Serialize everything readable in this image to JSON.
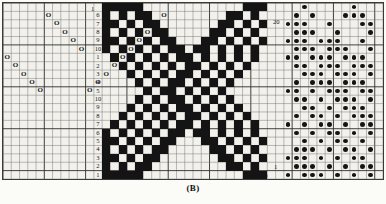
{
  "figure": {
    "caption": "(B)",
    "type": "weaving-draft",
    "grid": {
      "columns": 46,
      "rows": 21,
      "cell_w": 8.26,
      "cell_h": 8.35
    }
  },
  "edge_labels": [
    {
      "name": "top-threading-start",
      "text": "1",
      "x": 88,
      "y": 3
    },
    {
      "name": "top-treadling-end",
      "text": "20",
      "x": 270,
      "y": 16
    },
    {
      "name": "bottom-motif-start",
      "text": "1",
      "x": 115,
      "y": 170
    },
    {
      "name": "bottom-motif-end",
      "text": "20",
      "x": 258,
      "y": 170
    },
    {
      "name": "bottom-right-one",
      "text": "1",
      "x": 271,
      "y": 161
    }
  ],
  "shaft_column": {
    "name": "shaft-numbers",
    "col": 11,
    "values": [
      "6",
      "7",
      "8",
      "9",
      "10",
      "1",
      "2",
      "3",
      "4",
      "5",
      "10",
      "9",
      "8",
      "7",
      "6",
      "5",
      "4",
      "3",
      "2",
      "1"
    ]
  },
  "threading": {
    "name": "threading-marks",
    "symbol": "O",
    "marks": [
      [
        6,
        1
      ],
      [
        7,
        2
      ],
      [
        8,
        3
      ],
      [
        9,
        4
      ],
      [
        10,
        5
      ],
      [
        1,
        6
      ],
      [
        2,
        7
      ],
      [
        3,
        8
      ],
      [
        4,
        9
      ],
      [
        5,
        10
      ],
      [
        10,
        11
      ],
      [
        9,
        12
      ],
      [
        8,
        13
      ],
      [
        7,
        14
      ],
      [
        6,
        15
      ],
      [
        5,
        16
      ],
      [
        4,
        17
      ],
      [
        3,
        18
      ],
      [
        2,
        19
      ],
      [
        1,
        20
      ]
    ]
  },
  "motif": {
    "name": "center-motif",
    "start_col": 13,
    "width": 20,
    "rows": [
      "11111000000000000111",
      "10101100000000011010",
      "11010110000000110101",
      "10101011000001101010",
      "11010101100011010101",
      "10101010110110101010",
      "01010101011010101010",
      "00101010101101010100",
      "00010101011010101000",
      "00001010110101010000",
      "00000101101010100000",
      "00001010110101010000",
      "00010101011010101000",
      "00101010101101010100",
      "01010101011010101010",
      "10101010110110101010",
      "11010101100011010101",
      "10101011000001101010",
      "11010110000000110101",
      "10101100000000011010",
      "11111000000000000111"
    ]
  },
  "tie_up": {
    "name": "treadling-dots",
    "start_col": 35,
    "width": 11,
    "rows": [
      "00100000100",
      "01010001110",
      "11100100011",
      "01110010001",
      "11101110010",
      "01110111001",
      "11011101110",
      "01101110111",
      "00111011101",
      "01011101110",
      "11010111011",
      "01101011101",
      "00110101110",
      "01011010111",
      "10101101011",
      "01010110101",
      "00101011010",
      "01110101101",
      "11101010110",
      "01110101011",
      "10111010101"
    ]
  },
  "colors": {
    "ink": "#141414",
    "grid_line": "#6d6d6d",
    "grid_line_major": "#2e2e2e",
    "paper": "#f2f1ec",
    "page": "#fbfbf8"
  }
}
